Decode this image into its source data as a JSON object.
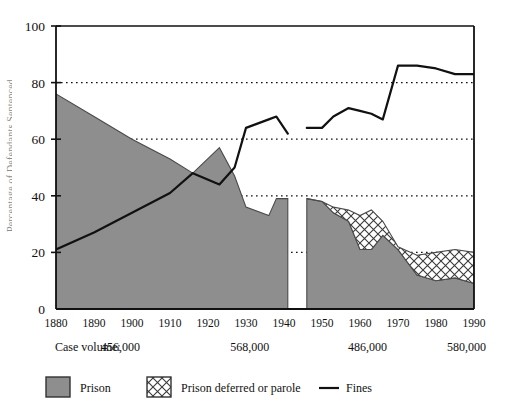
{
  "axes": {
    "y_label_partial": "Percentage of Defendants Sentenced",
    "y_ticks": [
      0,
      20,
      40,
      60,
      80,
      100
    ],
    "x_ticks": [
      1880,
      1890,
      1900,
      1910,
      1920,
      1930,
      1940,
      1950,
      1960,
      1970,
      1980,
      1990
    ]
  },
  "case_volume": {
    "label": "Case volume:",
    "values": [
      "456,000",
      "568,000",
      "486,000",
      "580,000"
    ]
  },
  "legend": [
    {
      "key": "prison",
      "label": "Prison",
      "swatch": "solid-gray-square",
      "color": "#8e8e8e"
    },
    {
      "key": "parole",
      "label": "Prison deferred or parole",
      "swatch": "crosshatch-square",
      "color": "#ffffff"
    },
    {
      "key": "fines",
      "label": "Fines",
      "swatch": "line-segment",
      "color": "#111111"
    }
  ],
  "chart_data": {
    "type": "area",
    "title": "",
    "xlabel": "",
    "ylabel": "Percentage of Defendants Sentenced",
    "xlim": [
      1880,
      1990
    ],
    "ylim": [
      0,
      100
    ],
    "grid": "dotted-horizontal",
    "legend_position": "bottom",
    "note": "Gap in area series between 1941 and 1946 (no data).",
    "series": [
      {
        "name": "Prison",
        "type": "area",
        "fill": "#8e8e8e",
        "segments": [
          {
            "x": [
              1880,
              1890,
              1900,
              1910,
              1916,
              1923,
              1927,
              1930,
              1936,
              1938,
              1941
            ],
            "values": [
              76,
              68,
              60,
              53,
              48,
              57,
              47,
              36,
              33,
              39,
              39
            ]
          },
          {
            "x": [
              1946,
              1950,
              1953,
              1957,
              1960,
              1963,
              1966,
              1970,
              1975,
              1980,
              1985,
              1990
            ],
            "values": [
              39,
              38,
              34,
              31,
              21,
              21,
              26,
              21,
              12,
              10,
              11,
              9
            ]
          }
        ]
      },
      {
        "name": "Prison deferred or parole",
        "type": "area",
        "fill": "crosshatch",
        "note": "Stacked on top of Prison; present only after 1946.",
        "segments": [
          {
            "x": [
              1946,
              1950,
              1953,
              1957,
              1960,
              1963,
              1966,
              1970,
              1975,
              1980,
              1985,
              1990
            ],
            "values_cumulative_top": [
              39,
              38,
              36,
              35,
              33,
              35,
              31,
              22,
              19,
              20,
              21,
              20
            ]
          }
        ]
      },
      {
        "name": "Fines",
        "type": "line",
        "color": "#111111",
        "segments": [
          {
            "x": [
              1880,
              1890,
              1900,
              1910,
              1916,
              1923,
              1927,
              1930,
              1936,
              1938,
              1941
            ],
            "values": [
              21,
              27,
              34,
              41,
              48,
              44,
              50,
              64,
              67,
              68,
              62
            ]
          },
          {
            "x": [
              1946,
              1950,
              1953,
              1957,
              1960,
              1963,
              1966,
              1970,
              1975,
              1980,
              1985,
              1990
            ],
            "values": [
              64,
              64,
              68,
              71,
              70,
              69,
              67,
              86,
              86,
              85,
              83,
              83
            ]
          }
        ]
      }
    ]
  }
}
